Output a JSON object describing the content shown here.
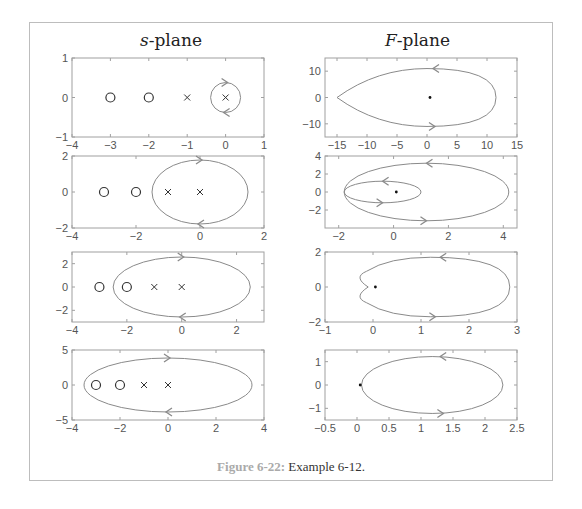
{
  "titles": {
    "s_plane_var": "s",
    "s_plane_rest": "-plane",
    "f_plane_var": "F",
    "f_plane_rest": "-plane"
  },
  "caption": {
    "label": "Figure 6-22:",
    "text": " Example 6-12."
  },
  "colors": {
    "contour": "#8a8a8a",
    "axes": "#a0a0a0",
    "markers": "#333333",
    "caption_label": "#aaaaaa"
  },
  "chart_data": [
    {
      "type": "scatter",
      "panel": "s-plane row 1",
      "xlim": [
        -4,
        1
      ],
      "ylim": [
        -1,
        1
      ],
      "xticks": [
        -4,
        -3,
        -2,
        -1,
        0,
        1
      ],
      "yticks": [
        -1,
        0,
        1
      ],
      "zeros": [
        [
          -3,
          0
        ],
        [
          -2,
          0
        ]
      ],
      "poles": [
        [
          -1,
          0
        ],
        [
          0,
          0
        ]
      ],
      "contour": {
        "shape": "circle",
        "center": [
          0,
          0
        ],
        "rx": 0.5,
        "ry": 0.7,
        "direction": "clockwise"
      }
    },
    {
      "type": "line",
      "panel": "F-plane row 1",
      "xlim": [
        -17,
        15
      ],
      "ylim": [
        -15,
        15
      ],
      "xticks": [
        -15,
        -10,
        -5,
        0,
        5,
        10,
        15
      ],
      "yticks": [
        -10,
        0,
        10
      ],
      "origin_dot": [
        0.5,
        0
      ],
      "contour": {
        "shape": "teardrop",
        "left": -15,
        "right": 11.5,
        "top": 11,
        "bottom": -11,
        "direction": "counterclockwise"
      }
    },
    {
      "type": "scatter",
      "panel": "s-plane row 2",
      "xlim": [
        -4,
        2
      ],
      "ylim": [
        -2,
        2
      ],
      "xticks": [
        -4,
        -2,
        0,
        2
      ],
      "yticks": [
        -2,
        0,
        2
      ],
      "zeros": [
        [
          -3,
          0
        ],
        [
          -2,
          0
        ]
      ],
      "poles": [
        [
          -1,
          0
        ],
        [
          0,
          0
        ]
      ],
      "contour": {
        "shape": "ellipse",
        "center": [
          0,
          0
        ],
        "rx": 1.5,
        "ry": 1.5,
        "direction": "clockwise"
      }
    },
    {
      "type": "line",
      "panel": "F-plane row 2",
      "xlim": [
        -2.5,
        4.5
      ],
      "ylim": [
        -4,
        4
      ],
      "xticks": [
        -2,
        0,
        2,
        4
      ],
      "yticks": [
        -2,
        0,
        2,
        4
      ],
      "origin_dot": [
        0.1,
        0
      ],
      "contour": {
        "shape": "double loop",
        "outer": {
          "left": -1.8,
          "right": 4.2,
          "top": 3.2,
          "bottom": -3.2
        },
        "inner": {
          "left": -1.8,
          "right": 1,
          "top": 1.2,
          "bottom": -1.2
        },
        "direction": "counterclockwise (encircles twice)"
      }
    },
    {
      "type": "scatter",
      "panel": "s-plane row 3",
      "xlim": [
        -4,
        3
      ],
      "ylim": [
        -3,
        3
      ],
      "xticks": [
        -4,
        -2,
        0,
        2
      ],
      "yticks": [
        -2,
        0,
        2
      ],
      "zeros": [
        [
          -3,
          0
        ],
        [
          -2,
          0
        ]
      ],
      "poles": [
        [
          -1,
          0
        ],
        [
          0,
          0
        ]
      ],
      "contour": {
        "shape": "ellipse",
        "center": [
          0,
          0
        ],
        "rx": 2.5,
        "ry": 2.5,
        "direction": "clockwise"
      }
    },
    {
      "type": "line",
      "panel": "F-plane row 3",
      "xlim": [
        -1,
        3
      ],
      "ylim": [
        -2,
        2
      ],
      "xticks": [
        -1,
        0,
        1,
        2,
        3
      ],
      "yticks": [
        -2,
        0,
        2
      ],
      "origin_dot": [
        0.05,
        0
      ],
      "contour": {
        "shape": "cardioid-like",
        "left": -0.3,
        "cusp": -0.1,
        "right": 2.85,
        "top": 1.7,
        "bottom": -1.7,
        "direction": "counterclockwise"
      }
    },
    {
      "type": "scatter",
      "panel": "s-plane row 4",
      "xlim": [
        -4,
        4
      ],
      "ylim": [
        -5,
        5
      ],
      "xticks": [
        -4,
        -2,
        0,
        2,
        4
      ],
      "yticks": [
        -5,
        0,
        5
      ],
      "zeros": [
        [
          -3,
          0
        ],
        [
          -2,
          0
        ]
      ],
      "poles": [
        [
          -1,
          0
        ],
        [
          0,
          0
        ]
      ],
      "contour": {
        "shape": "ellipse",
        "center": [
          0,
          0
        ],
        "rx": 3.5,
        "ry": 3.5,
        "direction": "clockwise"
      }
    },
    {
      "type": "line",
      "panel": "F-plane row 4",
      "xlim": [
        -0.5,
        2.5
      ],
      "ylim": [
        -1.5,
        1.5
      ],
      "xticks": [
        -0.5,
        0,
        0.5,
        1,
        1.5,
        2,
        2.5
      ],
      "yticks": [
        -1,
        0,
        1
      ],
      "origin_dot": [
        0.05,
        0
      ],
      "contour": {
        "shape": "ellipse-like",
        "left": 0.07,
        "right": 2.28,
        "top": 1.22,
        "bottom": -1.22,
        "direction": "counterclockwise"
      }
    }
  ]
}
